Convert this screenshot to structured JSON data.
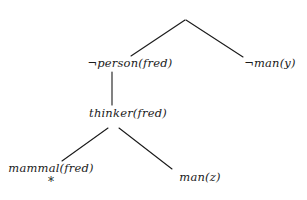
{
  "diagram": {
    "type": "resolution-refutation-proof-tree",
    "background_color": "#ffffff",
    "line_color": "#1a1a1a",
    "text_color": "#1a1a1a",
    "nodes": [
      {
        "id": "root",
        "label": "",
        "negated": false,
        "x": 185,
        "y": 19,
        "anchor": "center"
      },
      {
        "id": "person",
        "label": "person(fred)",
        "negated": true,
        "x": 130,
        "y": 64,
        "anchor": "center"
      },
      {
        "id": "many",
        "label": "man(y)",
        "negated": true,
        "x": 270,
        "y": 64,
        "anchor": "center"
      },
      {
        "id": "thinker",
        "label": "thinker(fred)",
        "negated": false,
        "x": 128,
        "y": 114,
        "anchor": "center"
      },
      {
        "id": "mammal",
        "label": "mammal(fred)",
        "negated": false,
        "x": 51,
        "y": 169,
        "anchor": "center"
      },
      {
        "id": "manz",
        "label": "man(z)",
        "negated": false,
        "x": 200,
        "y": 178,
        "anchor": "center"
      }
    ],
    "edges": [
      {
        "from": "root",
        "to": "person",
        "x1": 185,
        "y1": 20,
        "x2": 131,
        "y2": 56
      },
      {
        "from": "root",
        "to": "many",
        "x1": 186,
        "y1": 20,
        "x2": 243,
        "y2": 57
      },
      {
        "from": "person",
        "to": "thinker",
        "x1": 112,
        "y1": 72,
        "x2": 112,
        "y2": 105
      },
      {
        "from": "thinker",
        "to": "mammal",
        "x1": 108,
        "y1": 128,
        "x2": 62,
        "y2": 161
      },
      {
        "from": "thinker",
        "to": "manz",
        "x1": 119,
        "y1": 128,
        "x2": 172,
        "y2": 169
      }
    ],
    "annotations": [
      {
        "id": "closed-branch-marker",
        "symbol": "*",
        "x": 51,
        "y": 182
      }
    ],
    "negation_symbol": "¬"
  }
}
